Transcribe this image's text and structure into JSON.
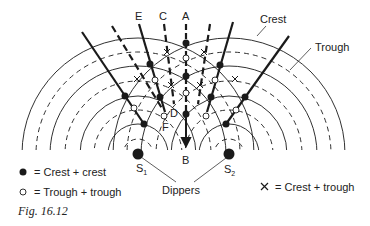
{
  "figure": {
    "caption": "Fig. 16.12",
    "sources": [
      {
        "id": "S1",
        "label": "S",
        "sub": "1",
        "x": 138,
        "y": 154
      },
      {
        "id": "S2",
        "label": "S",
        "sub": "2",
        "x": 229,
        "y": 154
      }
    ],
    "line_labels": {
      "A": "A",
      "B": "B",
      "C": "C",
      "D": "D",
      "E": "E",
      "F": "F"
    },
    "annotations": {
      "crest": "Crest",
      "trough": "Trough",
      "dippers": "Dippers"
    },
    "legend": {
      "crest_crest": "= Crest + crest",
      "trough_trough": "= Trough + trough",
      "crest_trough": "= Crest + trough"
    },
    "colors": {
      "ink": "#1a1a1a",
      "background": "#ffffff"
    }
  }
}
